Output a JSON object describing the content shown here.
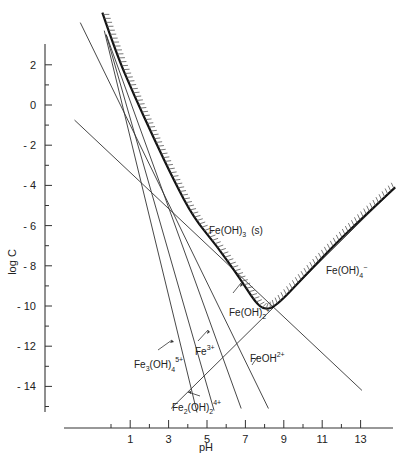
{
  "chart_data": {
    "type": "line",
    "title": "",
    "xlabel": "pH",
    "ylabel": "log C",
    "xlim": [
      -1,
      14
    ],
    "ylim": [
      -15.5,
      3
    ],
    "grid": false,
    "x_ticks_major": [
      1,
      3,
      5,
      7,
      9,
      11,
      13
    ],
    "x_tick_labels": [
      "1",
      "3",
      "5",
      "7",
      "9",
      "11",
      "13"
    ],
    "x_ticks_minor": [
      0,
      2,
      4,
      6,
      8,
      10,
      12
    ],
    "y_ticks_major": [
      2,
      0,
      -2,
      -4,
      -6,
      -8,
      -10,
      -12,
      -14
    ],
    "y_tick_labels": [
      "2",
      "0",
      "-2",
      "-4",
      "-6",
      "-8",
      "-10",
      "-12",
      "-14"
    ],
    "y_ticks_minor": [
      1,
      -1,
      -3,
      -5,
      -7,
      -9,
      -11,
      -13,
      -15
    ],
    "series": [
      {
        "name": "FeOH2+",
        "label": "FeOH",
        "charge": "2+",
        "points": [
          [
            -1.6,
            4.1
          ],
          [
            8.2,
            -15.1
          ]
        ]
      },
      {
        "name": "Fe3+",
        "label": "Fe",
        "charge": "3+",
        "points": [
          [
            -0.25,
            3.5
          ],
          [
            6.78,
            -15.1
          ]
        ]
      },
      {
        "name": "Fe2(OH)2 4+",
        "label": "Fe2(OH)2",
        "charge": "4+",
        "points": [
          [
            -0.25,
            3.5
          ],
          [
            5.37,
            -15.2
          ]
        ]
      },
      {
        "name": "Fe3(OH)4 5+",
        "label": "Fe3(OH)4",
        "charge": "5+",
        "points": [
          [
            -0.35,
            3.7
          ],
          [
            4.48,
            -15.3
          ]
        ]
      },
      {
        "name": "Fe(OH)2+",
        "label": "Fe(OH)2",
        "charge": "+",
        "points": [
          [
            -1.9,
            -0.75
          ],
          [
            13.07,
            -14.2
          ]
        ]
      },
      {
        "name": "Fe(OH)4-",
        "label": "Fe(OH)4",
        "charge": "-",
        "points": [
          [
            3.13,
            -15.1
          ],
          [
            14.8,
            -4.1
          ]
        ]
      }
    ],
    "solubility_boundary": {
      "name": "Total soluble Fe(III) in equilibrium with Fe(OH)3(s)",
      "points": [
        [
          -0.45,
          4.6
        ],
        [
          0.3,
          2.5
        ],
        [
          1.2,
          0.5
        ],
        [
          2.2,
          -1.6
        ],
        [
          3.3,
          -3.8
        ],
        [
          4.3,
          -5.6
        ],
        [
          5.5,
          -7.0
        ],
        [
          6.7,
          -8.6
        ],
        [
          7.5,
          -9.8
        ],
        [
          8.0,
          -10.2
        ],
        [
          8.6,
          -10.0
        ],
        [
          10.0,
          -8.6
        ],
        [
          12.0,
          -6.6
        ],
        [
          14.8,
          -4.1
        ]
      ]
    },
    "annotations": [
      {
        "text": "Fe(OH)3 (s)",
        "region": "above boundary",
        "at": [
          7.3,
          -6.4
        ]
      },
      {
        "text": "Fe(OH)4-",
        "at": [
          12.2,
          -9.8
        ]
      },
      {
        "text": "Fe(OH)2+",
        "at": [
          6.8,
          -10.6
        ]
      },
      {
        "text": "Fe3+",
        "at": [
          4.2,
          -12.9
        ]
      },
      {
        "text": "FeOH2+",
        "at": [
          7.5,
          -12.6
        ]
      },
      {
        "text": "Fe3(OH)4 5+",
        "at": [
          0.4,
          -13.5
        ]
      },
      {
        "text": "Fe2(OH)2 4+",
        "at": [
          4.9,
          -15.0
        ]
      }
    ]
  },
  "labels": {
    "y_axis": "log C",
    "x_axis": "pH",
    "solid": "Fe(OH)",
    "solid_sub": "3",
    "solid_phase": "(s)",
    "feoh4": "Fe(OH)",
    "feoh4_sub": "4",
    "feoh4_sup": "−",
    "feoh2": "Fe(OH)",
    "feoh2_sub": "2",
    "feoh2_sup": "+",
    "fe3": "Fe",
    "fe3_sup": "3+",
    "feoh": "FeOH",
    "feoh_sup": "2+",
    "fe3oh4": "Fe",
    "fe3oh4_sub1": "3",
    "fe3oh4_mid": "(OH)",
    "fe3oh4_sub2": "4",
    "fe3oh4_sup": "5+",
    "fe2oh2": "Fe",
    "fe2oh2_sub1": "2",
    "fe2oh2_mid": "(OH)",
    "fe2oh2_sub2": "2",
    "fe2oh2_sup": "4+"
  }
}
